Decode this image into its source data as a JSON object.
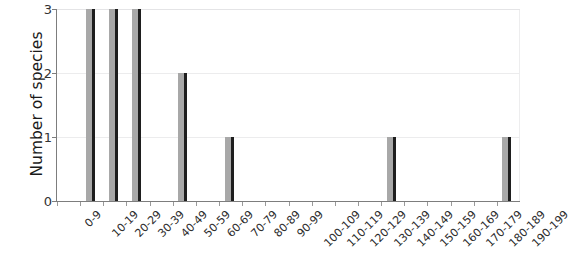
{
  "chart_data": {
    "type": "bar",
    "title": "",
    "xlabel": "",
    "ylabel": "Number of species",
    "ylim": [
      0,
      3
    ],
    "yticks": [
      "0",
      "1",
      "2",
      "3"
    ],
    "grid": true,
    "legend": "none",
    "categories": [
      "0-9",
      "10-19",
      "20-29",
      "30-39",
      "40-49",
      "50-59",
      "60-69",
      "70-79",
      "80-89",
      "90-99",
      "100-109",
      "110-119",
      "120-129",
      "130-139",
      "140-149",
      "150-159",
      "160-169",
      "170-179",
      "180-189",
      "190-199"
    ],
    "values": [
      0,
      3,
      3,
      3,
      0,
      2,
      0,
      1,
      0,
      0,
      0,
      0,
      0,
      0,
      1,
      0,
      0,
      0,
      0,
      1
    ],
    "bar_fill_color": "#a8a8a8",
    "bar_edge_color": "#1e1e1e",
    "gridline_color": "#ececed",
    "axis_color": "#7d7d7d"
  }
}
